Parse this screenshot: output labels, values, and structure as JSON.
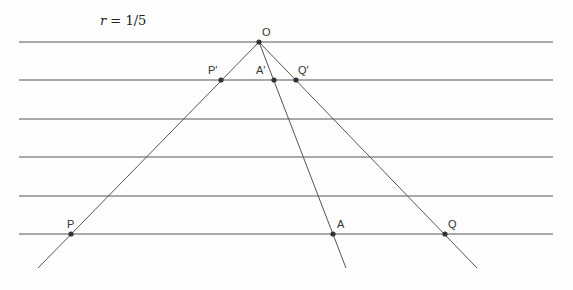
{
  "diagram": {
    "ratio_label": {
      "variable": "r",
      "equals": " = ",
      "value": "1/5"
    },
    "style": {
      "line_color": "#555555",
      "point_color": "#333333",
      "background": "#fefefe"
    },
    "parallel_lines": [
      {
        "y": 42,
        "x1": 19,
        "x2": 553
      },
      {
        "y": 80,
        "x1": 19,
        "x2": 553
      },
      {
        "y": 119,
        "x1": 19,
        "x2": 553
      },
      {
        "y": 157,
        "x1": 19,
        "x2": 553
      },
      {
        "y": 196,
        "x1": 19,
        "x2": 553
      },
      {
        "y": 234,
        "x1": 19,
        "x2": 553
      }
    ],
    "rays": [
      {
        "from": "O",
        "to": "P",
        "x1": 259,
        "y1": 42,
        "x2": 38,
        "y2": 268
      },
      {
        "from": "O",
        "to": "A",
        "x1": 259,
        "y1": 42,
        "x2": 346,
        "y2": 268
      },
      {
        "from": "O",
        "to": "Q",
        "x1": 259,
        "y1": 42,
        "x2": 477,
        "y2": 268
      }
    ],
    "points": [
      {
        "name": "O",
        "x": 259,
        "y": 42,
        "label_x": 262,
        "label_y": 36
      },
      {
        "name": "P'",
        "x": 221,
        "y": 80,
        "label_x": 208,
        "label_y": 74
      },
      {
        "name": "A'",
        "x": 274,
        "y": 80,
        "label_x": 256,
        "label_y": 74
      },
      {
        "name": "Q'",
        "x": 296,
        "y": 80,
        "label_x": 298,
        "label_y": 74
      },
      {
        "name": "P",
        "x": 71,
        "y": 234,
        "label_x": 67,
        "label_y": 228
      },
      {
        "name": "A",
        "x": 333,
        "y": 234,
        "label_x": 337,
        "label_y": 228
      },
      {
        "name": "Q",
        "x": 445,
        "y": 234,
        "label_x": 448,
        "label_y": 228
      }
    ]
  }
}
